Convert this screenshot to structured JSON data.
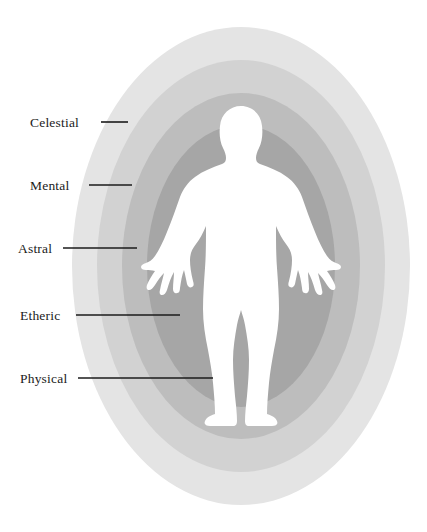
{
  "diagram": {
    "background_color": "#ffffff",
    "center": {
      "x": 241,
      "y": 266
    },
    "layers": [
      {
        "id": "celestial",
        "label": "Celestial",
        "color": "#e4e4e4",
        "rx": 169,
        "ry": 239,
        "order": 5,
        "leader": {
          "text_x": 30,
          "text_y": 127,
          "line_x1": 101,
          "line_x2": 128,
          "line_y": 122
        }
      },
      {
        "id": "mental",
        "label": "Mental",
        "color": "#d2d2d2",
        "rx": 144,
        "ry": 206,
        "order": 4,
        "leader": {
          "text_x": 30,
          "text_y": 190,
          "line_x1": 89,
          "line_x2": 132,
          "line_y": 185
        }
      },
      {
        "id": "astral",
        "label": "Astral",
        "color": "#bdbdbd",
        "rx": 119,
        "ry": 173,
        "order": 3,
        "leader": {
          "text_x": 18,
          "text_y": 253,
          "line_x1": 63,
          "line_x2": 137,
          "line_y": 248
        }
      },
      {
        "id": "etheric",
        "label": "Etheric",
        "color": "#a6a6a6",
        "rx": 94,
        "ry": 141,
        "order": 2,
        "leader": {
          "text_x": 20,
          "text_y": 320,
          "line_x1": 76,
          "line_x2": 180,
          "line_y": 315
        }
      },
      {
        "id": "physical",
        "label": "Physical",
        "color": "#ffffff",
        "order": 1,
        "leader": {
          "text_x": 20,
          "text_y": 383,
          "line_x1": 78,
          "line_x2": 213,
          "line_y": 378
        }
      }
    ],
    "figure": {
      "name": "human-silhouette",
      "color": "#ffffff",
      "description": "standing human figure, arms out from sides, palms spread"
    }
  }
}
